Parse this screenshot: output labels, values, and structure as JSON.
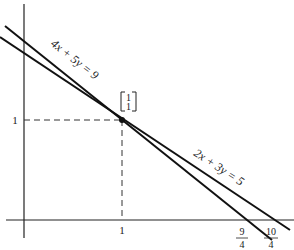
{
  "diagram": {
    "lines": [
      {
        "equation": "4x + 5y = 9",
        "x_intercept_label": {
          "num": "9",
          "den": "4"
        }
      },
      {
        "equation": "2x + 3y = 5",
        "x_intercept_label": {
          "num": "10",
          "den": "4"
        }
      }
    ],
    "intersection_point": {
      "vector_top": "1",
      "vector_bottom": "1"
    },
    "axis_ticks": {
      "x_tick": "1",
      "y_tick": "1"
    },
    "caption_fragment": "2.  The ..."
  }
}
